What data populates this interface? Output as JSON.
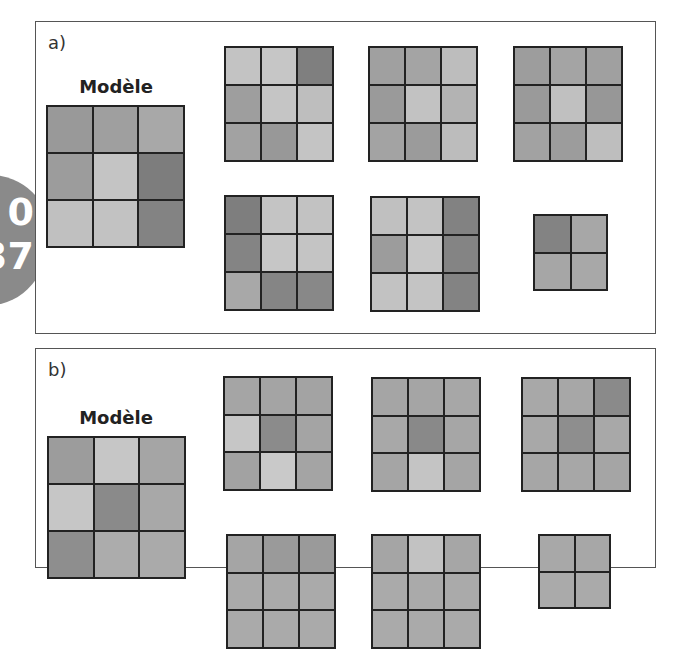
{
  "badge": {
    "line1": "0",
    "line2": "37"
  },
  "exercises": [
    {
      "label": "a)",
      "model_title": "Modèle",
      "model": {
        "size": 3,
        "cells": [
          "#999999",
          "#9f9f9f",
          "#a8a8a8",
          "#9c9c9c",
          "#c4c4c4",
          "#7d7d7d",
          "#c0c0c0",
          "#c2c2c2",
          "#838383"
        ]
      },
      "options": [
        {
          "size": 3,
          "cells": [
            "#c3c3c3",
            "#c6c6c6",
            "#7f7f7f",
            "#9e9e9e",
            "#c5c5c5",
            "#bebebe",
            "#a2a2a2",
            "#989898",
            "#c4c4c4"
          ]
        },
        {
          "size": 3,
          "cells": [
            "#a0a0a0",
            "#a4a4a4",
            "#bdbdbd",
            "#9a9a9a",
            "#c2c2c2",
            "#b3b3b3",
            "#a3a3a3",
            "#9b9b9b",
            "#bcbcbc"
          ]
        },
        {
          "size": 3,
          "cells": [
            "#9d9d9d",
            "#a4a4a4",
            "#a0a0a0",
            "#9a9a9a",
            "#c0c0c0",
            "#979797",
            "#a2a2a2",
            "#9c9c9c",
            "#bebebe"
          ]
        },
        {
          "size": 3,
          "cells": [
            "#7e7e7e",
            "#c4c4c4",
            "#c2c2c2",
            "#848484",
            "#c6c6c6",
            "#c4c4c4",
            "#a8a8a8",
            "#858585",
            "#888888"
          ]
        },
        {
          "size": 3,
          "cells": [
            "#c0c0c0",
            "#c3c3c3",
            "#828282",
            "#9c9c9c",
            "#c7c7c7",
            "#848484",
            "#c2c2c2",
            "#c4c4c4",
            "#838383"
          ]
        },
        {
          "size": 2,
          "cells": [
            "#838383",
            "#a7a7a7",
            "#a6a6a6",
            "#a8a8a8"
          ]
        }
      ]
    },
    {
      "label": "b)",
      "model_title": "Modèle",
      "model": {
        "size": 3,
        "cells": [
          "#9c9c9c",
          "#c6c6c6",
          "#a5a5a5",
          "#c6c6c6",
          "#8a8a8a",
          "#a8a8a8",
          "#8e8e8e",
          "#acacac",
          "#aaaaaa"
        ]
      },
      "options": [
        {
          "size": 3,
          "cells": [
            "#a5a5a5",
            "#a4a4a4",
            "#a3a3a3",
            "#c6c6c6",
            "#8b8b8b",
            "#a4a4a4",
            "#a2a2a2",
            "#c9c9c9",
            "#a4a4a4"
          ]
        },
        {
          "size": 3,
          "cells": [
            "#a5a5a5",
            "#a5a5a5",
            "#a7a7a7",
            "#a8a8a8",
            "#898989",
            "#a6a6a6",
            "#a5a5a5",
            "#c4c4c4",
            "#a5a5a5"
          ]
        },
        {
          "size": 3,
          "cells": [
            "#a8a8a8",
            "#a7a7a7",
            "#8a8a8a",
            "#a8a8a8",
            "#8e8e8e",
            "#a8a8a8",
            "#a6a6a6",
            "#a7a7a7",
            "#a5a5a5"
          ]
        },
        {
          "size": 3,
          "cells": [
            "#a5a5a5",
            "#9a9a9a",
            "#9a9a9a",
            "#aaaaaa",
            "#aaaaaa",
            "#aaaaaa",
            "#aaaaaa",
            "#aaaaaa",
            "#aaaaaa"
          ]
        },
        {
          "size": 3,
          "cells": [
            "#a5a5a5",
            "#c2c2c2",
            "#a6a6a6",
            "#aaaaaa",
            "#aaaaaa",
            "#aaaaaa",
            "#aaaaaa",
            "#aaaaaa",
            "#aaaaaa"
          ]
        },
        {
          "size": 2,
          "cells": [
            "#a8a8a8",
            "#a7a7a7",
            "#aaaaaa",
            "#aaaaaa"
          ]
        }
      ]
    }
  ]
}
